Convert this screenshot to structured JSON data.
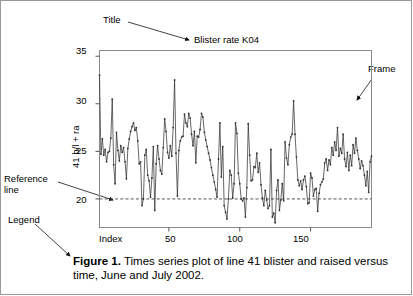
{
  "figure": {
    "plot_title": "Blister rate K04",
    "caption_bold": "Figure 1.",
    "caption_text": " Times series plot of line 41 blister and raised versus time, June and July 2002."
  },
  "annotations": {
    "title": "Title",
    "frame": "Frame",
    "reference_line_1": "Reference",
    "reference_line_2": "line",
    "legend": "Legend"
  },
  "chart_data": {
    "type": "line",
    "title": "Blister rate K04",
    "xlabel": "Index",
    "ylabel": "41 b/l + ra",
    "xlim": [
      1,
      193
    ],
    "ylim": [
      17.0,
      35.6
    ],
    "xticks": [
      50,
      100,
      150
    ],
    "yticks": [
      35,
      30,
      25,
      20
    ],
    "grid": false,
    "legend": "none",
    "markers": "filled-circle",
    "reference_line": {
      "orientation": "horizontal",
      "y": 20,
      "style": "dashed",
      "color": "#555555"
    },
    "series": [
      {
        "name": "41 b/l + ra",
        "color": "#333333",
        "x": [
          1,
          2,
          3,
          4,
          5,
          6,
          7,
          8,
          9,
          10,
          11,
          12,
          13,
          14,
          15,
          16,
          17,
          18,
          19,
          20,
          21,
          22,
          23,
          24,
          25,
          26,
          27,
          28,
          29,
          30,
          31,
          32,
          33,
          34,
          35,
          36,
          37,
          38,
          39,
          40,
          41,
          42,
          43,
          44,
          45,
          46,
          47,
          48,
          49,
          50,
          51,
          52,
          53,
          54,
          55,
          56,
          57,
          58,
          59,
          60,
          61,
          62,
          63,
          64,
          65,
          66,
          67,
          68,
          69,
          70,
          71,
          72,
          73,
          74,
          75,
          76,
          77,
          78,
          79,
          80,
          81,
          82,
          83,
          84,
          85,
          86,
          87,
          88,
          89,
          90,
          91,
          92,
          93,
          94,
          95,
          96,
          97,
          98,
          99,
          100,
          101,
          102,
          103,
          104,
          105,
          106,
          107,
          108,
          109,
          110,
          111,
          112,
          113,
          114,
          115,
          116,
          117,
          118,
          119,
          120,
          121,
          122,
          123,
          124,
          125,
          126,
          127,
          128,
          129,
          130,
          131,
          132,
          133,
          134,
          135,
          136,
          137,
          138,
          139,
          140,
          141,
          142,
          143,
          144,
          145,
          146,
          147,
          148,
          149,
          150,
          151,
          152,
          153,
          154,
          155,
          156,
          157,
          158,
          159,
          160,
          161,
          162,
          163,
          164,
          165,
          166,
          167,
          168,
          169,
          170,
          171,
          172,
          173,
          174,
          175,
          176,
          177,
          178,
          179,
          180,
          181,
          182,
          183,
          184,
          185,
          186,
          187,
          188,
          189,
          190,
          191,
          192,
          193
        ],
        "values": [
          33.0,
          24.7,
          26.3,
          24.6,
          25.2,
          23.9,
          24.9,
          25.0,
          26.4,
          30.5,
          23.6,
          21.6,
          27.0,
          25.1,
          24.0,
          25.6,
          24.9,
          25.4,
          23.9,
          22.1,
          25.3,
          26.3,
          27.1,
          27.6,
          28.0,
          27.2,
          27.5,
          26.1,
          23.7,
          23.9,
          19.3,
          20.0,
          24.6,
          25.2,
          22.5,
          21.9,
          20.2,
          22.2,
          25.5,
          18.8,
          23.7,
          25.6,
          24.2,
          23.0,
          22.6,
          25.4,
          28.4,
          27.1,
          24.9,
          24.3,
          25.6,
          24.5,
          27.5,
          32.5,
          24.8,
          20.3,
          25.1,
          26.1,
          26.5,
          26.6,
          28.9,
          28.0,
          27.6,
          29.0,
          28.5,
          26.8,
          25.6,
          27.1,
          23.8,
          26.6,
          26.5,
          27.3,
          29.0,
          28.6,
          27.0,
          26.2,
          25.5,
          24.8,
          24.1,
          23.3,
          22.5,
          21.8,
          21.0,
          20.2,
          24.2,
          28.0,
          22.3,
          25.5,
          19.3,
          18.6,
          17.9,
          20.0,
          23.0,
          22.5,
          20.1,
          21.6,
          28.0,
          26.9,
          22.7,
          21.6,
          20.0,
          19.8,
          20.1,
          18.1,
          21.2,
          27.9,
          24.6,
          21.9,
          22.0,
          23.4,
          23.3,
          24.8,
          22.8,
          23.8,
          21.5,
          20.1,
          19.3,
          20.9,
          19.9,
          19.0,
          19.3,
          25.2,
          18.1,
          18.5,
          17.5,
          20.9,
          22.0,
          18.8,
          19.9,
          21.6,
          19.8,
          26.0,
          24.3,
          23.6,
          25.7,
          26.5,
          26.8,
          30.3,
          26.8,
          24.4,
          22.0,
          21.4,
          21.9,
          21.0,
          22.0,
          22.4,
          21.3,
          19.5,
          19.6,
          22.7,
          22.2,
          20.3,
          21.0,
          21.1,
          18.7,
          20.6,
          21.5,
          21.8,
          22.1,
          23.8,
          24.2,
          23.0,
          24.1,
          23.6,
          25.4,
          24.6,
          26.0,
          25.1,
          27.5,
          24.5,
          25.3,
          24.8,
          26.8,
          24.2,
          23.4,
          24.9,
          23.0,
          24.6,
          23.5,
          25.7,
          24.8,
          26.4,
          25.1,
          24.2,
          23.2,
          24.0,
          23.5,
          22.5,
          21.4,
          22.9,
          20.7,
          23.9,
          24.5
        ]
      }
    ]
  }
}
